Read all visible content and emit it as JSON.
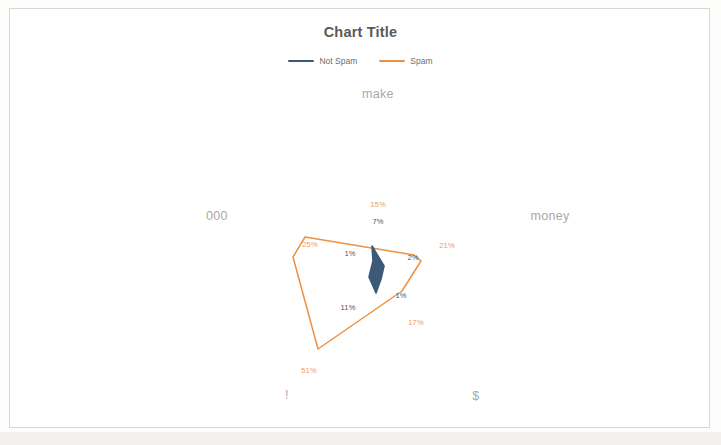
{
  "chart": {
    "title": "Chart Title",
    "legend": {
      "position": "top",
      "entries": [
        {
          "label": "Not Spam",
          "color": "#3c5a78"
        },
        {
          "label": "Spam",
          "color": "#ed9140"
        }
      ]
    }
  },
  "chart_data": {
    "type": "radar",
    "title": "Chart Title",
    "xlabel": "",
    "ylabel": "",
    "categories": [
      "make",
      "money",
      "$",
      "!",
      "000",
      ""
    ],
    "series": [
      {
        "name": "Not Spam",
        "color": "#3c5a78",
        "values": [
          7,
          2,
          1,
          11,
          1,
          1
        ],
        "labels": [
          "7%",
          "2%",
          "1%",
          "11%",
          "1%",
          "1%"
        ]
      },
      {
        "name": "Spam",
        "color": "#ed9140",
        "values": [
          15,
          21,
          17,
          51,
          25,
          25
        ],
        "labels": [
          "15%",
          "21%",
          "17%",
          "51%",
          "25%",
          "25%"
        ]
      }
    ],
    "grid": false,
    "axis_lines": false,
    "tick_labels": [],
    "legend_position": "top"
  },
  "category_labels": [
    {
      "text": "make",
      "x": 368,
      "y": 85
    },
    {
      "text": "money",
      "x": 540,
      "y": 207
    },
    {
      "text": "$",
      "x": 466,
      "y": 387
    },
    {
      "text": "!",
      "x": 277,
      "y": 386
    },
    {
      "text": "000",
      "x": 207,
      "y": 207
    }
  ],
  "data_labels": [
    {
      "text": "15%",
      "x": 368,
      "y": 195,
      "series": "spam"
    },
    {
      "text": "7%",
      "x": 368,
      "y": 212,
      "series": "notspam"
    },
    {
      "text": "21%",
      "x": 437,
      "y": 236,
      "series": "spam"
    },
    {
      "text": "2%",
      "x": 403,
      "y": 248,
      "series": "notspam"
    },
    {
      "text": "17%",
      "x": 406,
      "y": 313,
      "series": "spam"
    },
    {
      "text": "1%",
      "x": 391,
      "y": 286,
      "series": "notspam"
    },
    {
      "text": "51%",
      "x": 299,
      "y": 361,
      "series": "spam"
    },
    {
      "text": "11%",
      "x": 338,
      "y": 298,
      "series": "notspam"
    },
    {
      "text": "25%",
      "x": 300,
      "y": 235,
      "series": "spam"
    },
    {
      "text": "1%",
      "x": 340,
      "y": 244,
      "series": "notspam"
    }
  ],
  "geometry": {
    "spam_polygon": "295,228 404,246 411,252 392,282 308,340 283,248",
    "notspam_polygon": "362,237 368,247 374,257 371,270 366,284 359,268 363,252"
  }
}
